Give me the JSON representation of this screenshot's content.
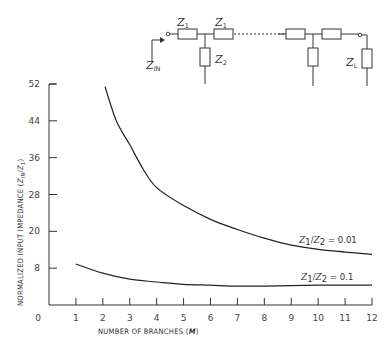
{
  "circuit": {
    "labels": {
      "z1_first": "Z",
      "z1_first_sub": "1",
      "z1_second": "Z",
      "z1_second_sub": "1",
      "z2": "Z",
      "z2_sub": "2",
      "zin": "Z",
      "zin_sub": "IN",
      "zl": "Z",
      "zl_sub": "L"
    }
  },
  "chart_data": {
    "type": "line",
    "title": "",
    "xlabel": "NUMBER OF BRANCHES",
    "xlabel_var": "M",
    "ylabel": "NORMALIZED INPUT IMPEDANCE",
    "ylabel_ratio": "Z",
    "ylabel_ratio_sub1": "IN",
    "ylabel_ratio_sub2": "1",
    "xlim": [
      0,
      12
    ],
    "ylim": [
      4,
      52
    ],
    "x_ticks": [
      {
        "value": 0,
        "label": "0"
      },
      {
        "value": 1,
        "label": "1"
      },
      {
        "value": 2,
        "label": "2"
      },
      {
        "value": 3,
        "label": "3"
      },
      {
        "value": 4,
        "label": "4"
      },
      {
        "value": 5,
        "label": "5"
      },
      {
        "value": 6,
        "label": "6"
      },
      {
        "value": 7,
        "label": "7"
      },
      {
        "value": 8,
        "label": "8"
      },
      {
        "value": 9,
        "label": "9"
      },
      {
        "value": 10,
        "label": "10"
      },
      {
        "value": 11,
        "label": "11"
      },
      {
        "value": 12,
        "label": "12"
      }
    ],
    "y_ticks": [
      {
        "value": 12,
        "label": "8"
      },
      {
        "value": 20,
        "label": "20"
      },
      {
        "value": 28,
        "label": "28"
      },
      {
        "value": 36,
        "label": "36"
      },
      {
        "value": 44,
        "label": "44"
      },
      {
        "value": 52,
        "label": "52"
      }
    ],
    "grid": false,
    "legend": "none",
    "series": [
      {
        "name": "Z1/Z2 = 0.01",
        "annotation": {
          "ratio_a": "Z",
          "sub_a": "1",
          "ratio_b": "Z",
          "sub_b": "2",
          "value": " = 0.01"
        },
        "x": [
          2.08,
          2.5,
          3,
          3.5,
          4,
          5,
          6,
          7,
          8,
          9,
          10,
          11,
          12
        ],
        "y": [
          51.4,
          44.0,
          38.8,
          33.5,
          29.5,
          25.6,
          22.6,
          20.4,
          18.5,
          17.0,
          16.1,
          15.5,
          15.0
        ]
      },
      {
        "name": "Z1/Z2 = 0.1",
        "annotation": {
          "ratio_a": "Z",
          "sub_a": "1",
          "ratio_b": "Z",
          "sub_b": "2",
          "value": " = 0.1"
        },
        "x": [
          1,
          2,
          3,
          4,
          5,
          6,
          7,
          8,
          9,
          10,
          11,
          12
        ],
        "y": [
          12.9,
          10.9,
          9.6,
          9.0,
          8.5,
          8.3,
          8.1,
          8.1,
          8.2,
          8.3,
          8.3,
          8.3
        ]
      }
    ]
  }
}
